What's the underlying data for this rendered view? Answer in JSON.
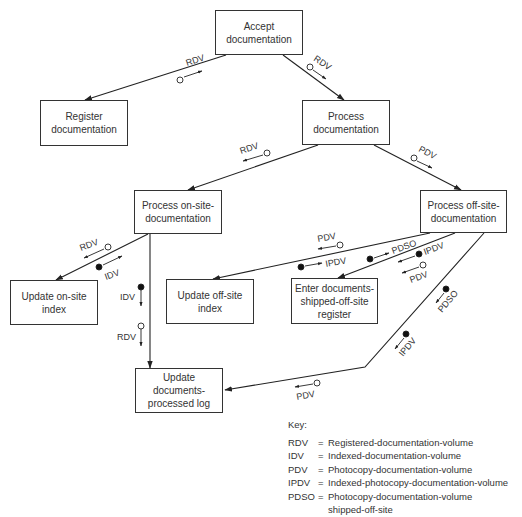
{
  "nodes": [
    {
      "id": "accept",
      "label": "Accept documentation",
      "x": 215,
      "y": 10,
      "w": 88,
      "h": 45
    },
    {
      "id": "register",
      "label": "Register documentation",
      "x": 40,
      "y": 100,
      "w": 88,
      "h": 46
    },
    {
      "id": "process",
      "label": "Process documentation",
      "x": 302,
      "y": 100,
      "w": 88,
      "h": 45
    },
    {
      "id": "onsite",
      "label": "Process on-site-documentation",
      "x": 134,
      "y": 190,
      "w": 88,
      "h": 44
    },
    {
      "id": "offsite",
      "label": "Process off-site-documentation",
      "x": 420,
      "y": 190,
      "w": 87,
      "h": 43
    },
    {
      "id": "upd_onsite",
      "label": "Update on-site index",
      "x": 10,
      "y": 280,
      "w": 88,
      "h": 45
    },
    {
      "id": "upd_offsite",
      "label": "Update off-site index",
      "x": 166,
      "y": 279,
      "w": 88,
      "h": 45
    },
    {
      "id": "enter_shipped",
      "label": "Enter documents-shipped-off-site register",
      "x": 291,
      "y": 278,
      "w": 87,
      "h": 46
    },
    {
      "id": "upd_log",
      "label": "Update documents-processed log",
      "x": 135,
      "y": 368,
      "w": 88,
      "h": 45
    }
  ],
  "couples": [
    {
      "label": "RDV",
      "type": "data",
      "near": "accept-register"
    },
    {
      "label": "RDV",
      "type": "data",
      "near": "accept-process"
    },
    {
      "label": "RDV",
      "type": "data",
      "near": "process-onsite"
    },
    {
      "label": "PDV",
      "type": "data",
      "near": "process-offsite"
    },
    {
      "label": "RDV",
      "type": "data",
      "near": "onsite-upd_onsite (returned)"
    },
    {
      "label": "IDV",
      "type": "control",
      "near": "onsite-upd_onsite (passed)"
    },
    {
      "label": "IDV",
      "type": "control",
      "near": "onsite-upd_log"
    },
    {
      "label": "RDV",
      "type": "data",
      "near": "onsite-upd_log"
    },
    {
      "label": "PDV",
      "type": "data",
      "near": "offsite-upd_offsite"
    },
    {
      "label": "IPDV",
      "type": "control",
      "near": "offsite-upd_offsite"
    },
    {
      "label": "PDSO",
      "type": "control",
      "near": "offsite-enter_shipped"
    },
    {
      "label": "IPDV",
      "type": "control",
      "near": "offsite-enter_shipped"
    },
    {
      "label": "PDV",
      "type": "data",
      "near": "offsite-enter_shipped"
    },
    {
      "label": "PDSO",
      "type": "control",
      "near": "offsite-upd_log"
    },
    {
      "label": "IPDV",
      "type": "control",
      "near": "offsite-upd_log"
    },
    {
      "label": "PDV",
      "type": "data",
      "near": "offsite-upd_log"
    }
  ],
  "key": {
    "title": "Key:",
    "entries": [
      {
        "abbr": "RDV",
        "def": "Registered-documentation-volume"
      },
      {
        "abbr": "IDV",
        "def": "Indexed-documentation-volume"
      },
      {
        "abbr": "PDV",
        "def": "Photocopy-documentation-volume"
      },
      {
        "abbr": "IPDV",
        "def": "Indexed-photocopy-documentation-volume"
      },
      {
        "abbr": "PDSO",
        "def": "Photocopy-documentation-volume shipped-off-site"
      }
    ]
  }
}
